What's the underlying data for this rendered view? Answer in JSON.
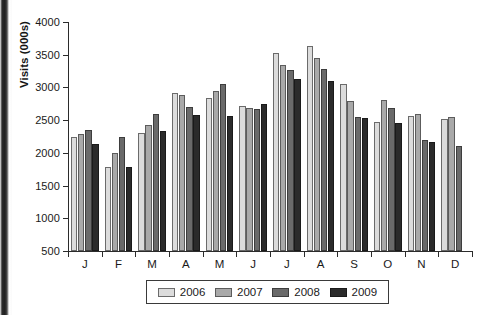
{
  "chart_data": {
    "type": "bar",
    "title": "",
    "xlabel": "",
    "ylabel": "Visits (000s)",
    "ylim": [
      500,
      4000
    ],
    "ytick_step": 500,
    "yticks": [
      500,
      1000,
      1500,
      2000,
      2500,
      3000,
      3500,
      4000
    ],
    "grid": false,
    "legend_position": "bottom",
    "categories": [
      "J",
      "F",
      "M",
      "A",
      "M",
      "J",
      "J",
      "A",
      "S",
      "O",
      "N",
      "D"
    ],
    "category_names": [
      "January",
      "February",
      "March",
      "April",
      "May",
      "June",
      "July",
      "August",
      "September",
      "October",
      "November",
      "December"
    ],
    "series": [
      {
        "name": "2006",
        "color": "#dcdcdc",
        "values": [
          2250,
          1780,
          2300,
          2920,
          2840,
          2720,
          3530,
          3640,
          3060,
          2470,
          2560,
          2520
        ]
      },
      {
        "name": "2007",
        "color": "#a9a9a9",
        "values": [
          2295,
          2000,
          2430,
          2880,
          2950,
          2680,
          3340,
          3450,
          2800,
          2810,
          2600,
          2550
        ]
      },
      {
        "name": "2008",
        "color": "#6a6a6a",
        "values": [
          2345,
          2250,
          2595,
          2700,
          3050,
          2665,
          3270,
          3280,
          2550,
          2690,
          2200,
          2110
        ]
      },
      {
        "name": "2009",
        "color": "#2b2b2b",
        "values": [
          2130,
          1790,
          2340,
          2580,
          2560,
          2750,
          3130,
          3100,
          2530,
          2450,
          2160,
          null
        ]
      }
    ]
  },
  "legend": {
    "items": [
      {
        "label": "2006"
      },
      {
        "label": "2007"
      },
      {
        "label": "2008"
      },
      {
        "label": "2009"
      }
    ]
  },
  "colors": {
    "series_2006": "#dcdcdc",
    "series_2007": "#a9a9a9",
    "series_2008": "#6a6a6a",
    "series_2009": "#2b2b2b",
    "axis": "#2b2b2b",
    "text": "#1a1a1a",
    "background": "#ffffff"
  }
}
